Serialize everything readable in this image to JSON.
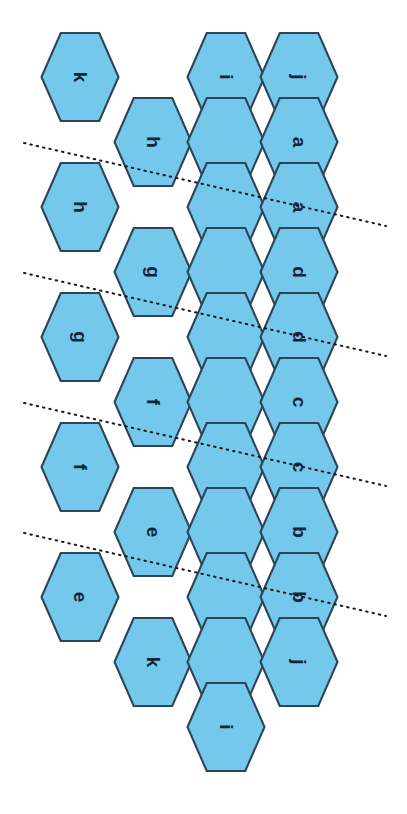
{
  "diagram": {
    "type": "hexagonal-net",
    "width": 407,
    "height": 814,
    "background_color": "#ffffff"
  },
  "style": {
    "hex_fill": "#74C8EC",
    "hex_stroke": "#2E4558",
    "label_color": "#13253B",
    "fold_line_color": "#1A1A1A",
    "label_rotation_deg": 90,
    "hex_orientation": "flat-left-right",
    "hex_width": 77,
    "hex_height": 88
  },
  "columns": [
    {
      "name": "col-0",
      "center_x": 80
    },
    {
      "name": "col-1",
      "center_x": 153
    },
    {
      "name": "col-2",
      "center_x": 226
    },
    {
      "name": "col-3",
      "center_x": 299
    }
  ],
  "hexagons": [
    {
      "id": "hex-k-top",
      "label": "k",
      "col": 0,
      "cx": 80,
      "cy": 77,
      "labeled": true
    },
    {
      "id": "hex-i-top",
      "label": "i",
      "col": 2,
      "cx": 226,
      "cy": 77,
      "labeled": true
    },
    {
      "id": "hex-j-top",
      "label": "j",
      "col": 3,
      "cx": 299,
      "cy": 77,
      "labeled": true
    },
    {
      "id": "hex-h-1",
      "label": "h",
      "col": 1,
      "cx": 153,
      "cy": 142,
      "labeled": true
    },
    {
      "id": "hex-blank-1",
      "label": "",
      "col": 2,
      "cx": 226,
      "cy": 142,
      "labeled": false
    },
    {
      "id": "hex-a-1",
      "label": "a",
      "col": 3,
      "cx": 299,
      "cy": 142,
      "labeled": true
    },
    {
      "id": "hex-h-2",
      "label": "h",
      "col": 0,
      "cx": 80,
      "cy": 207,
      "labeled": true
    },
    {
      "id": "hex-blank-2",
      "label": "",
      "col": 2,
      "cx": 226,
      "cy": 207,
      "labeled": false
    },
    {
      "id": "hex-a-2",
      "label": "a",
      "col": 3,
      "cx": 299,
      "cy": 207,
      "labeled": true
    },
    {
      "id": "hex-g-1",
      "label": "g",
      "col": 1,
      "cx": 153,
      "cy": 272,
      "labeled": true
    },
    {
      "id": "hex-blank-3",
      "label": "",
      "col": 2,
      "cx": 226,
      "cy": 272,
      "labeled": false
    },
    {
      "id": "hex-d-1",
      "label": "d",
      "col": 3,
      "cx": 299,
      "cy": 272,
      "labeled": true
    },
    {
      "id": "hex-g-2",
      "label": "g",
      "col": 0,
      "cx": 80,
      "cy": 337,
      "labeled": true
    },
    {
      "id": "hex-blank-4",
      "label": "",
      "col": 2,
      "cx": 226,
      "cy": 337,
      "labeled": false
    },
    {
      "id": "hex-d-2",
      "label": "d",
      "col": 3,
      "cx": 299,
      "cy": 337,
      "labeled": true
    },
    {
      "id": "hex-f-1",
      "label": "f",
      "col": 1,
      "cx": 153,
      "cy": 402,
      "labeled": true
    },
    {
      "id": "hex-blank-5",
      "label": "",
      "col": 2,
      "cx": 226,
      "cy": 402,
      "labeled": false
    },
    {
      "id": "hex-c-1",
      "label": "c",
      "col": 3,
      "cx": 299,
      "cy": 402,
      "labeled": true
    },
    {
      "id": "hex-f-2",
      "label": "f",
      "col": 0,
      "cx": 80,
      "cy": 467,
      "labeled": true
    },
    {
      "id": "hex-blank-6",
      "label": "",
      "col": 2,
      "cx": 226,
      "cy": 467,
      "labeled": false
    },
    {
      "id": "hex-c-2",
      "label": "c",
      "col": 3,
      "cx": 299,
      "cy": 467,
      "labeled": true
    },
    {
      "id": "hex-e-1",
      "label": "e",
      "col": 1,
      "cx": 153,
      "cy": 532,
      "labeled": true
    },
    {
      "id": "hex-blank-7",
      "label": "",
      "col": 2,
      "cx": 226,
      "cy": 532,
      "labeled": false
    },
    {
      "id": "hex-b-1",
      "label": "b",
      "col": 3,
      "cx": 299,
      "cy": 532,
      "labeled": true
    },
    {
      "id": "hex-e-2",
      "label": "e",
      "col": 0,
      "cx": 80,
      "cy": 597,
      "labeled": true
    },
    {
      "id": "hex-blank-8",
      "label": "",
      "col": 2,
      "cx": 226,
      "cy": 597,
      "labeled": false
    },
    {
      "id": "hex-b-2",
      "label": "b",
      "col": 3,
      "cx": 299,
      "cy": 597,
      "labeled": true
    },
    {
      "id": "hex-k-bot",
      "label": "k",
      "col": 1,
      "cx": 153,
      "cy": 662,
      "labeled": true
    },
    {
      "id": "hex-blank-9",
      "label": "",
      "col": 2,
      "cx": 226,
      "cy": 662,
      "labeled": false
    },
    {
      "id": "hex-j-bot",
      "label": "j",
      "col": 3,
      "cx": 299,
      "cy": 662,
      "labeled": true
    },
    {
      "id": "hex-i-bot",
      "label": "i",
      "col": 2,
      "cx": 226,
      "cy": 727,
      "labeled": true
    }
  ],
  "fold_lines": [
    {
      "id": "fold-line-1",
      "x1": 24,
      "y1": 143,
      "x2": 386,
      "y2": 226
    },
    {
      "id": "fold-line-2",
      "x1": 24,
      "y1": 273,
      "x2": 386,
      "y2": 356
    },
    {
      "id": "fold-line-3",
      "x1": 24,
      "y1": 403,
      "x2": 386,
      "y2": 486
    },
    {
      "id": "fold-line-4",
      "x1": 24,
      "y1": 533,
      "x2": 386,
      "y2": 616
    }
  ],
  "labels_used": [
    "a",
    "b",
    "c",
    "d",
    "e",
    "f",
    "g",
    "h",
    "i",
    "j",
    "k"
  ],
  "label_counts": {
    "a": 2,
    "b": 2,
    "c": 2,
    "d": 2,
    "e": 2,
    "f": 2,
    "g": 2,
    "h": 2,
    "i": 2,
    "j": 2,
    "k": 2
  }
}
